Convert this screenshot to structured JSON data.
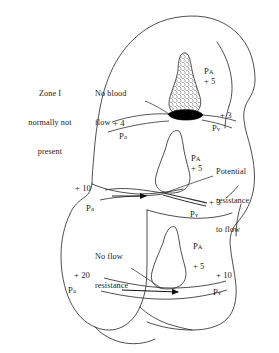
{
  "figure": {
    "background_color": "#ffffff",
    "line_color": "#2b2b2b",
    "stipple_color": "#2b2b2b",
    "collapsed_vessel_color": "#000000"
  },
  "annotations": {
    "zone_one_note": {
      "line1": "Zone I",
      "line2": "normally not",
      "line3": "present"
    },
    "no_blood_flow": {
      "line1": "No blood",
      "line2": "flow"
    },
    "potential_resistance": {
      "line1": "Potential",
      "line2": "resistance",
      "line3": "to flow"
    },
    "no_flow_resistance": {
      "line1": "No flow",
      "line2": "resistance"
    }
  },
  "zones": [
    {
      "id": "zone-1",
      "name": "Zone I",
      "alveolar": {
        "label": "P",
        "subscript": "A",
        "value": "+ 5"
      },
      "arterial": {
        "label": "P",
        "subscript": "a",
        "value": "+ 4"
      },
      "venous": {
        "label": "P",
        "subscript": "v",
        "value": "+ 3"
      },
      "flow_state": "No blood flow",
      "vessel_state": "collapsed"
    },
    {
      "id": "zone-2",
      "name": "Zone II",
      "alveolar": {
        "label": "P",
        "subscript": "A",
        "value": "+ 5"
      },
      "arterial": {
        "label": "P",
        "subscript": "a",
        "value": "+ 10"
      },
      "venous": {
        "label": "P",
        "subscript": "v",
        "value": "+ 3"
      },
      "flow_state": "Potential resistance to flow",
      "vessel_state": "partially compressed"
    },
    {
      "id": "zone-3",
      "name": "Zone III",
      "alveolar": {
        "label": "P",
        "subscript": "A",
        "value": "+ 5"
      },
      "arterial": {
        "label": "P",
        "subscript": "a",
        "value": "+ 20"
      },
      "venous": {
        "label": "P",
        "subscript": "v",
        "value": "+ 10"
      },
      "flow_state": "No flow resistance",
      "vessel_state": "open"
    }
  ],
  "labels": {
    "pa_alv_1": "P",
    "pa_alv_1_sub": "A",
    "pa_alv_1_val": "+ 5",
    "pa_art_1": "P",
    "pa_art_1_sub": "a",
    "pa_art_1_val": "+ 4",
    "pv_ven_1": "P",
    "pv_ven_1_sub": "v",
    "pv_ven_1_val": "+ 3",
    "pa_alv_2": "P",
    "pa_alv_2_sub": "A",
    "pa_alv_2_val": "+ 5",
    "pa_art_2": "P",
    "pa_art_2_sub": "a",
    "pa_art_2_val": "+ 10",
    "pv_ven_2": "P",
    "pv_ven_2_sub": "v",
    "pv_ven_2_val": "+ 3",
    "pa_alv_3": "P",
    "pa_alv_3_sub": "A",
    "pa_alv_3_val": "+ 5",
    "pa_art_3": "P",
    "pa_art_3_sub": "a",
    "pa_art_3_val": "+ 20",
    "pv_ven_3": "P",
    "pv_ven_3_sub": "v",
    "pv_ven_3_val": "+ 10"
  }
}
